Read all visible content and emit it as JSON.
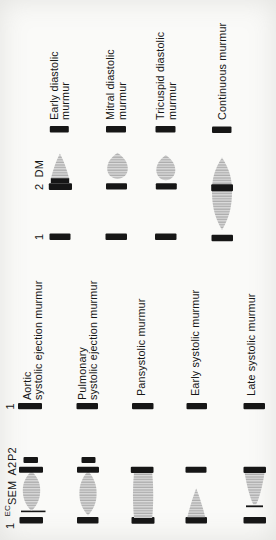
{
  "figure": {
    "systolic_group": {
      "header": {
        "s1_start": "1",
        "ec": "EC",
        "sem": "SEM",
        "a2": "A2",
        "p2": "P2",
        "s1_end": "1"
      },
      "rows": [
        {
          "label_lines": [
            "Aortic",
            "systolic ejection murmur"
          ]
        },
        {
          "label_lines": [
            "Pulmonary",
            "systolic ejection murmur"
          ]
        },
        {
          "label_lines": [
            "Pansystolic murmur"
          ]
        },
        {
          "label_lines": [
            "Early systolic murmur"
          ]
        },
        {
          "label_lines": [
            "Late systolic murmur"
          ]
        }
      ]
    },
    "diastolic_group": {
      "header": {
        "s1": "1",
        "s2": "2",
        "dm": "DM"
      },
      "rows": [
        {
          "label_lines": [
            "Early diastolic",
            "murmur"
          ]
        },
        {
          "label_lines": [
            "Mitral diastolic",
            "murmur"
          ]
        },
        {
          "label_lines": [
            "Tricuspid diastolic",
            "murmur"
          ]
        },
        {
          "label_lines": [
            "Continuous murmur"
          ]
        }
      ]
    },
    "colors": {
      "ink": "#161616",
      "murmur_fill": "#dcdcdc",
      "murmur_stripe": "#9e9e9e",
      "paper": "#fafaf8"
    }
  }
}
